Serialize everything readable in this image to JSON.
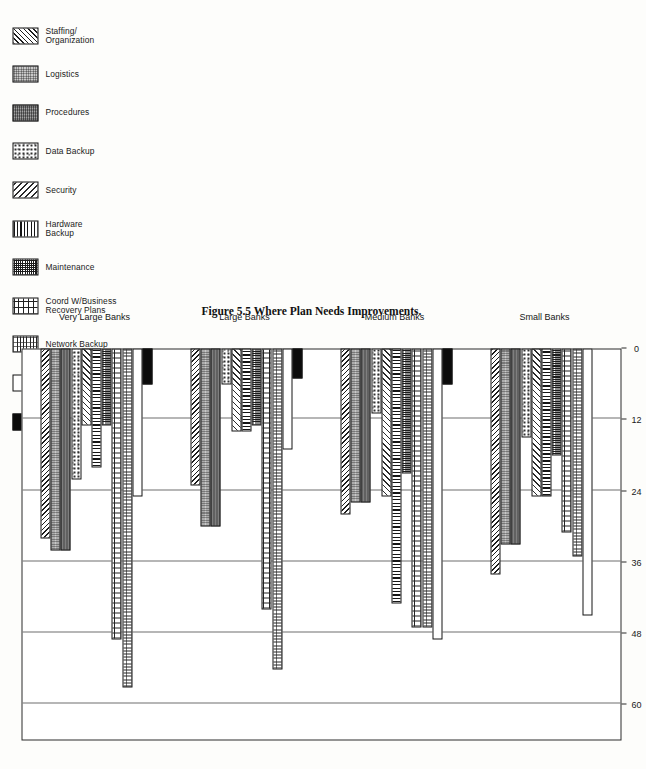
{
  "figure": {
    "caption": "Figure 5.5  Where Plan Needs Improvements.",
    "rotation_note": "page printed sideways"
  },
  "legend": {
    "title": "",
    "items": [
      {
        "label": "Staffing/\nOrganization",
        "pattern": "diagonal-hatch-left",
        "swatch_name": "legend-swatch-staffing-organization"
      },
      {
        "label": "Logistics",
        "pattern": "checker-gray",
        "swatch_name": "legend-swatch-logistics"
      },
      {
        "label": "Procedures",
        "pattern": "rough-dark-gray",
        "swatch_name": "legend-swatch-procedures"
      },
      {
        "label": "Data Backup",
        "pattern": "speckle",
        "swatch_name": "legend-swatch-data-backup"
      },
      {
        "label": "Security",
        "pattern": "diagonal-hatch-right",
        "swatch_name": "legend-swatch-security"
      },
      {
        "label": "Hardware\nBackup",
        "pattern": "vertical-lines",
        "swatch_name": "legend-swatch-hardware-backup"
      },
      {
        "label": "Maintenance",
        "pattern": "fine-grid",
        "swatch_name": "legend-swatch-maintenance"
      },
      {
        "label": "Coord W/Business\nRecovery Plans",
        "pattern": "brick",
        "swatch_name": "legend-swatch-coord-business-recovery-plans"
      },
      {
        "label": "Network Backup",
        "pattern": "wave",
        "swatch_name": "legend-swatch-network-backup"
      },
      {
        "label": "Testing",
        "pattern": "white",
        "swatch_name": "legend-swatch-testing"
      },
      {
        "label": "Other",
        "pattern": "black",
        "swatch_name": "legend-swatch-other"
      }
    ]
  },
  "chart_data": {
    "type": "bar",
    "orientation": "horizontal",
    "title": "Figure 5.5  Where Plan Needs Improvements.",
    "xlabel": "",
    "ylabel": "",
    "xlim": [
      0,
      66
    ],
    "ticks": [
      0,
      12,
      24,
      36,
      48,
      60
    ],
    "tick_labels": [
      "0",
      "12",
      "24",
      "36",
      "48",
      "60"
    ],
    "grid": true,
    "legend_position": "top-left",
    "categories": [
      "Staffing/Organization",
      "Logistics",
      "Procedures",
      "Data Backup",
      "Security",
      "Hardware Backup",
      "Maintenance",
      "Coord W/Business Recovery Plans",
      "Network Backup",
      "Testing",
      "Other"
    ],
    "groups": [
      "Small Banks",
      "Medium Banks",
      "Large Banks",
      "Very Large Banks"
    ],
    "series": [
      {
        "name": "Small Banks",
        "values": [
          38,
          33,
          33,
          15,
          25,
          25,
          18,
          31,
          35,
          45,
          0
        ]
      },
      {
        "name": "Medium Banks",
        "values": [
          28,
          26,
          26,
          11,
          25,
          43,
          21,
          47,
          47,
          49,
          6
        ]
      },
      {
        "name": "Large Banks",
        "values": [
          23,
          30,
          30,
          6,
          14,
          14,
          13,
          44,
          54,
          17,
          5
        ]
      },
      {
        "name": "Very Large Banks",
        "values": [
          32,
          34,
          34,
          22,
          13,
          20,
          13,
          49,
          57,
          25,
          6
        ]
      }
    ]
  },
  "axis": {
    "group_labels": [
      "Small Banks",
      "Medium Banks",
      "Large Banks",
      "Very Large Banks"
    ]
  }
}
